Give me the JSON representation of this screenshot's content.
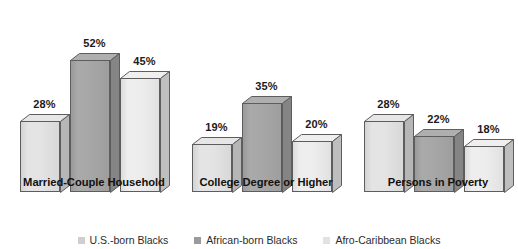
{
  "chart_data": {
    "type": "bar",
    "title": "",
    "subtitle": "",
    "xlabel": "",
    "ylabel": "",
    "grid": false,
    "legend_position": "bottom",
    "ylim": [
      0,
      60
    ],
    "value_suffix": "%",
    "categories": [
      "Married-Couple Household",
      "College Degree or Higher",
      "Persons in Poverty"
    ],
    "series": [
      {
        "name": "U.S.-born Blacks",
        "color": "#e3e3e3",
        "values": [
          28,
          19,
          28
        ],
        "labels": [
          "28%",
          "19%",
          "28%"
        ]
      },
      {
        "name": "African-born Blacks",
        "color": "#a6a6a6",
        "values": [
          52,
          35,
          22
        ],
        "labels": [
          "52%",
          "35%",
          "22%"
        ]
      },
      {
        "name": "Afro-Caribbean Blacks",
        "color": "#ededed",
        "values": [
          45,
          20,
          18
        ],
        "labels": [
          "45%",
          "20%",
          "18%"
        ]
      }
    ]
  },
  "legend": {
    "items": [
      {
        "label": "U.S.-born Blacks",
        "color": "#cfcfcf"
      },
      {
        "label": "African-born Blacks",
        "color": "#9a9a9a"
      },
      {
        "label": "Afro-Caribbean Blacks",
        "color": "#e2e2e2"
      }
    ]
  },
  "groups": [
    {
      "label": "Married-Couple Household",
      "bars": [
        {
          "series": "U.S.-born Blacks",
          "value": 28,
          "label": "28%"
        },
        {
          "series": "African-born Blacks",
          "value": 52,
          "label": "52%"
        },
        {
          "series": "Afro-Caribbean Blacks",
          "value": 45,
          "label": "45%"
        }
      ]
    },
    {
      "label": "College Degree or Higher",
      "bars": [
        {
          "series": "U.S.-born Blacks",
          "value": 19,
          "label": "19%"
        },
        {
          "series": "African-born Blacks",
          "value": 35,
          "label": "35%"
        },
        {
          "series": "Afro-Caribbean Blacks",
          "value": 20,
          "label": "20%"
        }
      ]
    },
    {
      "label": "Persons in Poverty",
      "bars": [
        {
          "series": "U.S.-born Blacks",
          "value": 28,
          "label": "28%"
        },
        {
          "series": "African-born Blacks",
          "value": 22,
          "label": "22%"
        },
        {
          "series": "Afro-Caribbean Blacks",
          "value": 18,
          "label": "18%"
        }
      ]
    }
  ]
}
